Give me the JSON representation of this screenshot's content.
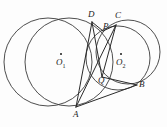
{
  "figure": {
    "kind": "geometry-diagram",
    "background_color": "#fdfdfd",
    "stroke_color": "#3a3a3a",
    "label_color": "#1b1b1b"
  },
  "circles": [
    {
      "name": "left-circle",
      "cx": 48.0,
      "cy": 62.0,
      "r": 44.0
    },
    {
      "name": "circle-o1",
      "cx": 69.0,
      "cy": 62.0,
      "r": 44.0,
      "center_label": "O",
      "center_sub": "1"
    },
    {
      "name": "circle-o2",
      "cx": 118.0,
      "cy": 58.0,
      "r": 32.0,
      "center_label": "O",
      "center_sub": "2"
    },
    {
      "name": "right-circle",
      "cx": 128.0,
      "cy": 52.0,
      "r": 32.0
    }
  ],
  "points": [
    {
      "name": "D",
      "label": "D",
      "x": 92.0,
      "y": 22.0,
      "label_x": 88,
      "label_y": 10
    },
    {
      "name": "C",
      "label": "C",
      "x": 116.0,
      "y": 25.0,
      "label_x": 115,
      "label_y": 11
    },
    {
      "name": "P",
      "label": "P",
      "x": 103.0,
      "y": 31.0,
      "label_x": 103,
      "label_y": 22
    },
    {
      "name": "Q",
      "label": "Q",
      "x": 102.0,
      "y": 77.0,
      "label_x": 98,
      "label_y": 76
    },
    {
      "name": "B",
      "label": "B",
      "x": 137.0,
      "y": 85.0,
      "label_x": 139,
      "label_y": 80
    },
    {
      "name": "A",
      "label": "A",
      "x": 76.0,
      "y": 107.0,
      "label_x": 73,
      "label_y": 110
    }
  ],
  "center_labels": [
    {
      "name": "O1",
      "letter": "O",
      "sub": "1",
      "dot_x": 61.0,
      "dot_y": 54.0,
      "label_x": 56,
      "label_y": 58
    },
    {
      "name": "O2",
      "letter": "O",
      "sub": "2",
      "dot_x": 121.0,
      "dot_y": 54.0,
      "label_x": 116,
      "label_y": 58
    }
  ],
  "segments": [
    {
      "name": "segment-D-P",
      "from": "D",
      "to": "P"
    },
    {
      "name": "segment-P-C",
      "from": "P",
      "to": "C"
    },
    {
      "name": "segment-D-Q",
      "from": "D",
      "to": "Q"
    },
    {
      "name": "segment-C-Q",
      "from": "C",
      "to": "Q"
    },
    {
      "name": "segment-D-A",
      "from": "D",
      "to": "A"
    },
    {
      "name": "segment-C-A",
      "from": "C",
      "to": "A"
    },
    {
      "name": "segment-Q-B",
      "from": "Q",
      "to": "B"
    },
    {
      "name": "segment-A-B",
      "from": "A",
      "to": "B"
    }
  ]
}
